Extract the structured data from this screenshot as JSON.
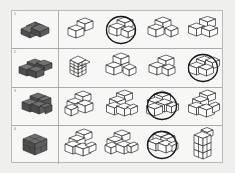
{
  "page": {
    "background_color": "#efefed",
    "sheet_background_color": "#f7f7f5",
    "border_color": "#b9b9b9",
    "divider_color": "#aaaaaa",
    "reference_fill_color": "#5a5a5a",
    "option_fill_color": "#ffffff",
    "outline_color": "#1a1a1a",
    "circle_color": "#111111"
  },
  "rows": [
    {
      "number": "1",
      "reference": {
        "name": "dark-cube-reference-row-1",
        "description": "dark 2x2 flat slab of cubes",
        "cube_count": 4
      },
      "options": [
        {
          "label": "a",
          "description": "L-shaped group of 3 cubes",
          "cube_count": 3,
          "selected": false
        },
        {
          "label": "b",
          "description": "2x2 flat slab of 4 cubes",
          "cube_count": 4,
          "selected": true
        },
        {
          "label": "c",
          "description": "row of cubes with offset cube",
          "cube_count": 4,
          "selected": false
        },
        {
          "label": "d",
          "description": "scattered group of 4 cubes",
          "cube_count": 4,
          "selected": false
        }
      ],
      "answer": "b"
    },
    {
      "number": "2",
      "reference": {
        "name": "dark-cube-reference-row-2",
        "description": "dark 2x3 flat slab of cubes",
        "cube_count": 6
      },
      "options": [
        {
          "label": "a",
          "description": "tall 2x2x2 block",
          "cube_count": 8,
          "selected": false
        },
        {
          "label": "b",
          "description": "stepped stack of 5 cubes",
          "cube_count": 5,
          "selected": false
        },
        {
          "label": "c",
          "description": "L-shaped group of 4 cubes",
          "cube_count": 4,
          "selected": false
        },
        {
          "label": "d",
          "description": "2x3 flat slab of 6 cubes",
          "cube_count": 6,
          "selected": true
        }
      ],
      "answer": "d"
    },
    {
      "number": "3",
      "reference": {
        "name": "dark-cube-reference-row-3",
        "description": "dark stepped stack of cubes",
        "cube_count": 8
      },
      "options": [
        {
          "label": "a",
          "description": "stepped stack of 6 cubes",
          "cube_count": 6,
          "selected": false
        },
        {
          "label": "b",
          "description": "stepped stack of 7 cubes",
          "cube_count": 7,
          "selected": false
        },
        {
          "label": "c",
          "description": "stepped stack of 8 cubes",
          "cube_count": 8,
          "selected": true
        },
        {
          "label": "d",
          "description": "stepped stack of 7 cubes",
          "cube_count": 7,
          "selected": false
        }
      ],
      "answer": "c"
    },
    {
      "number": "4",
      "reference": {
        "name": "dark-cube-reference-row-4",
        "description": "dark 2x2x2 solid cube",
        "cube_count": 8
      },
      "options": [
        {
          "label": "a",
          "description": "stepped stack of 6 cubes",
          "cube_count": 6,
          "selected": false
        },
        {
          "label": "b",
          "description": "branching group of 6 cubes",
          "cube_count": 6,
          "selected": false
        },
        {
          "label": "c",
          "description": "2x2x2 solid cube group",
          "cube_count": 8,
          "selected": true
        },
        {
          "label": "d",
          "description": "tall 2x3 stacked column",
          "cube_count": 6,
          "selected": false
        }
      ],
      "answer": "c"
    }
  ]
}
